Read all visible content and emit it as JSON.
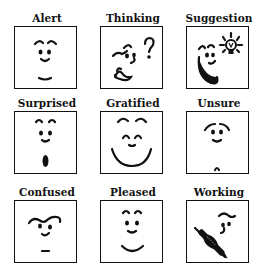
{
  "ink_color": "#111111",
  "faces": [
    {
      "id": "alert",
      "label": "Alert",
      "icon": "alert-face-icon"
    },
    {
      "id": "thinking",
      "label": "Thinking",
      "icon": "thinking-face-icon"
    },
    {
      "id": "suggestion",
      "label": "Suggestion",
      "icon": "suggestion-face-icon"
    },
    {
      "id": "surprised",
      "label": "Surprised",
      "icon": "surprised-face-icon"
    },
    {
      "id": "gratified",
      "label": "Gratified",
      "icon": "gratified-face-icon"
    },
    {
      "id": "unsure",
      "label": "Unsure",
      "icon": "unsure-face-icon"
    },
    {
      "id": "confused",
      "label": "Confused",
      "icon": "confused-face-icon"
    },
    {
      "id": "pleased",
      "label": "Pleased",
      "icon": "pleased-face-icon"
    },
    {
      "id": "working",
      "label": "Working",
      "icon": "working-face-icon"
    }
  ]
}
